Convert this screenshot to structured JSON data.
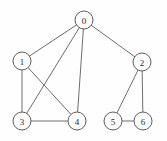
{
  "figure": {
    "width": 167,
    "height": 141,
    "background_color": "#fefefe",
    "node_fill_color": "#fefefe",
    "node_stroke_color": "#5f5f5f",
    "edge_color": "#6e6e6e",
    "label_color": "#2a2a2a",
    "node_radius": 9
  },
  "chart_data": {
    "type": "diagram",
    "diagram_kind": "node-link-graph",
    "directed": false,
    "title": "",
    "node_count": 7,
    "edge_count": 10,
    "nodes": [
      {
        "id": "0",
        "label": "0",
        "x": 84,
        "y": 20,
        "degree": 4
      },
      {
        "id": "1",
        "label": "1",
        "x": 22,
        "y": 61,
        "degree": 3
      },
      {
        "id": "2",
        "label": "2",
        "x": 142,
        "y": 62,
        "degree": 3
      },
      {
        "id": "3",
        "label": "3",
        "x": 22,
        "y": 121,
        "degree": 3
      },
      {
        "id": "4",
        "label": "4",
        "x": 77,
        "y": 121,
        "degree": 3
      },
      {
        "id": "5",
        "label": "5",
        "x": 113,
        "y": 121,
        "degree": 2
      },
      {
        "id": "6",
        "label": "6",
        "x": 143,
        "y": 121,
        "degree": 2
      }
    ],
    "edges": [
      {
        "source": "0",
        "target": "1"
      },
      {
        "source": "0",
        "target": "2"
      },
      {
        "source": "0",
        "target": "3"
      },
      {
        "source": "0",
        "target": "4"
      },
      {
        "source": "1",
        "target": "3"
      },
      {
        "source": "1",
        "target": "4"
      },
      {
        "source": "3",
        "target": "4"
      },
      {
        "source": "2",
        "target": "5"
      },
      {
        "source": "2",
        "target": "6"
      },
      {
        "source": "5",
        "target": "6"
      }
    ]
  }
}
